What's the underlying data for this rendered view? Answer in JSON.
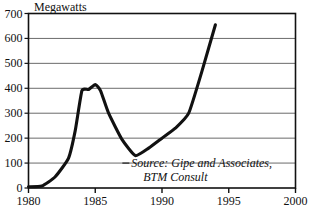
{
  "chart_data": {
    "type": "line",
    "title": "Megawatts",
    "xlabel": "",
    "ylabel": "Megawatts",
    "xlim": [
      1980,
      2000
    ],
    "ylim": [
      0,
      700
    ],
    "grid": "horizontal",
    "legend": "none",
    "x_ticks": [
      "1980",
      "1985",
      "1990",
      "1995",
      "2000"
    ],
    "x_tick_values": [
      1980,
      1985,
      1990,
      1995,
      2000
    ],
    "y_ticks": [
      "0",
      "100",
      "200",
      "300",
      "400",
      "500",
      "600",
      "700"
    ],
    "y_tick_values": [
      0,
      100,
      200,
      300,
      400,
      500,
      600,
      700
    ],
    "series": [
      {
        "name": "Annual wind capacity installed",
        "x": [
          1980,
          1981,
          1982,
          1983,
          1983.5,
          1984,
          1984.5,
          1985,
          1985.4,
          1986,
          1987,
          1988,
          1989,
          1990,
          1991,
          1992,
          1993,
          1994
        ],
        "values": [
          5,
          8,
          45,
          120,
          230,
          390,
          395,
          415,
          390,
          300,
          195,
          130,
          160,
          200,
          240,
          300,
          470,
          655
        ]
      }
    ],
    "annotations": [
      {
        "name": "source-note",
        "line1": "Source: Gipe and Associates,",
        "line2": "BTM Consult",
        "x": 1991.3,
        "y": 100
      }
    ],
    "colors": {
      "line": "#111111",
      "grid": "#6b6b6b",
      "frame": "#111111",
      "background": "#ffffff",
      "text": "#111111"
    }
  }
}
